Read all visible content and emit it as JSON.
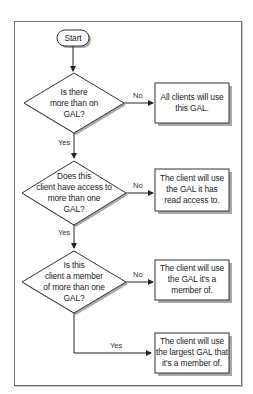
{
  "diagram": {
    "type": "flowchart",
    "start": {
      "label": "Start"
    },
    "decisions": [
      {
        "id": "d1",
        "label": "Is there more than on GAL?",
        "lines": [
          "Is there",
          "more than on",
          "GAL?"
        ]
      },
      {
        "id": "d2",
        "label": "Does this client have access to more than one GAL?",
        "lines": [
          "Does this",
          "client have access to",
          "more than one",
          "GAL?"
        ]
      },
      {
        "id": "d3",
        "label": "Is this client a member of more than one GAL?",
        "lines": [
          "Is this",
          "client a member",
          "of more than one",
          "GAL?"
        ]
      }
    ],
    "outcomes": [
      {
        "id": "o1",
        "lines": [
          "All clients will use",
          "this GAL."
        ]
      },
      {
        "id": "o2",
        "lines": [
          "The client will use",
          "the GAL it has",
          "read access to."
        ]
      },
      {
        "id": "o3",
        "lines": [
          "The client will use",
          "the GAL it's a",
          "member of."
        ]
      },
      {
        "id": "o4",
        "lines": [
          "The client will use",
          "the largest GAL that",
          "it's a member of."
        ]
      }
    ],
    "edges": [
      {
        "from": "start",
        "to": "d1",
        "label": ""
      },
      {
        "from": "d1",
        "to": "o1",
        "label": "No"
      },
      {
        "from": "d1",
        "to": "d2",
        "label": "Yes"
      },
      {
        "from": "d2",
        "to": "o2",
        "label": "No"
      },
      {
        "from": "d2",
        "to": "d3",
        "label": "Yes"
      },
      {
        "from": "d3",
        "to": "o3",
        "label": "No"
      },
      {
        "from": "d3",
        "to": "o4",
        "label": "Yes"
      }
    ],
    "colors": {
      "stroke": "#333333",
      "shadow": "#9a9a9a",
      "fill": "#ffffff"
    }
  }
}
